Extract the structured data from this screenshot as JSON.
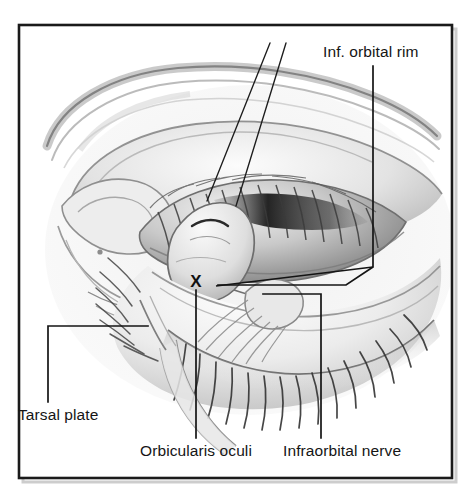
{
  "figure": {
    "kind": "anatomical-illustration",
    "style": "grayscale pencil and airbrush medical drawing",
    "background_color": "#ffffff",
    "ink_color": "#151515",
    "frame": {
      "present": true,
      "color": "#1a1a1a",
      "shadow_color": "#c8c8c8",
      "x": 19,
      "y": 25,
      "width": 433,
      "height": 453,
      "stroke_width": 2.6
    }
  },
  "labels": [
    {
      "id": "inf-orbital-rim",
      "text": "Inf. orbital rim",
      "position": "top-right",
      "leader": "vertical down then diagonal to lower-left, pointing at the infraorbital rim bone edge"
    },
    {
      "id": "tarsal-plate",
      "text": "Tarsal plate",
      "position": "bottom-left",
      "leader": "vertical up then horizontal right, pointing at the tarsal plate"
    },
    {
      "id": "orbicularis-oculi",
      "text": "Orbicularis oculi",
      "position": "bottom-center",
      "leader": "vertical up to the X marker on the orbicularis oculi muscle"
    },
    {
      "id": "infraorbital-nerve",
      "text": "Infraorbital nerve",
      "position": "bottom-right",
      "leader": "vertical up then horizontal left, pointing at the infraorbital nerve"
    }
  ],
  "markers": [
    {
      "id": "x-marker",
      "glyph": "X",
      "x": 196,
      "y": 281,
      "meaning": "orbicularis oculi reference point"
    }
  ],
  "instrument_lines": [
    {
      "id": "retractor-line-1",
      "from": [
        270,
        43
      ],
      "to": [
        207,
        201
      ]
    },
    {
      "id": "retractor-line-2",
      "from": [
        286,
        43
      ],
      "to": [
        236,
        206
      ]
    }
  ],
  "colors": {
    "ink": "#151515",
    "frame": "#1a1a1a",
    "paper": "#ffffff",
    "shade_light": "#ededed",
    "shade_mid": "#bdbdbd",
    "shade_dark": "#6e6e6e",
    "shade_deep": "#2a2a2a"
  }
}
